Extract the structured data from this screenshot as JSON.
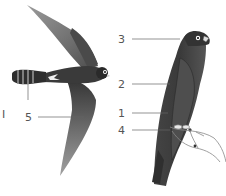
{
  "figure": {
    "colors": {
      "background": "#ffffff",
      "plumage_dark": "#3a3a3a",
      "plumage_mid": "#5a5a5a",
      "wing_light": "#8a8a8a",
      "leader_line": "#666666",
      "label_text": "#555555"
    },
    "labels": {
      "left_marker": "I",
      "flying_wing": "5",
      "perched_head": "3",
      "perched_back": "2",
      "perched_breast": "1",
      "perched_feet": "4"
    }
  }
}
